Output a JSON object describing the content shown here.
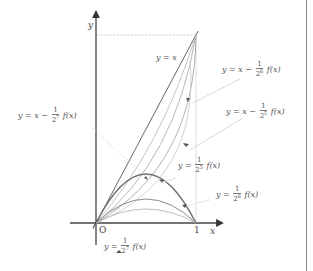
{
  "figure": {
    "axes": {
      "x_label": "x",
      "y_label": "y",
      "origin_label": "O",
      "x_tick_label": "1"
    },
    "labels": [
      {
        "id": "y_eq_x",
        "text": "y = x"
      },
      {
        "id": "x_minus_2_6",
        "prefix": "y = x −",
        "num": "1",
        "base": "2",
        "exp": "6",
        "suffix": "f(x)"
      },
      {
        "id": "x_minus_2_5",
        "prefix": "y = x −",
        "num": "1",
        "base": "2",
        "exp": "5",
        "suffix": "f(x)"
      },
      {
        "id": "x_minus_2_7",
        "prefix": "y = x −",
        "num": "1",
        "base": "2",
        "exp": "7",
        "suffix": "f(x)"
      },
      {
        "id": "f_2_5",
        "prefix": "y =",
        "num": "1",
        "base": "2",
        "exp": "5",
        "suffix": "f(x)"
      },
      {
        "id": "f_2_6",
        "prefix": "y =",
        "num": "1",
        "base": "2",
        "exp": "6",
        "suffix": "f(x)"
      },
      {
        "id": "f_2_7",
        "prefix": "y =",
        "num": "1",
        "base": "2",
        "exp": "7",
        "suffix": "f(x)"
      }
    ],
    "colors": {
      "axis": "#555555",
      "curve_dark": "#777777",
      "curve_light": "#b5b5b5",
      "leader": "#c8c8c8",
      "border": "#8a8a8a"
    }
  }
}
